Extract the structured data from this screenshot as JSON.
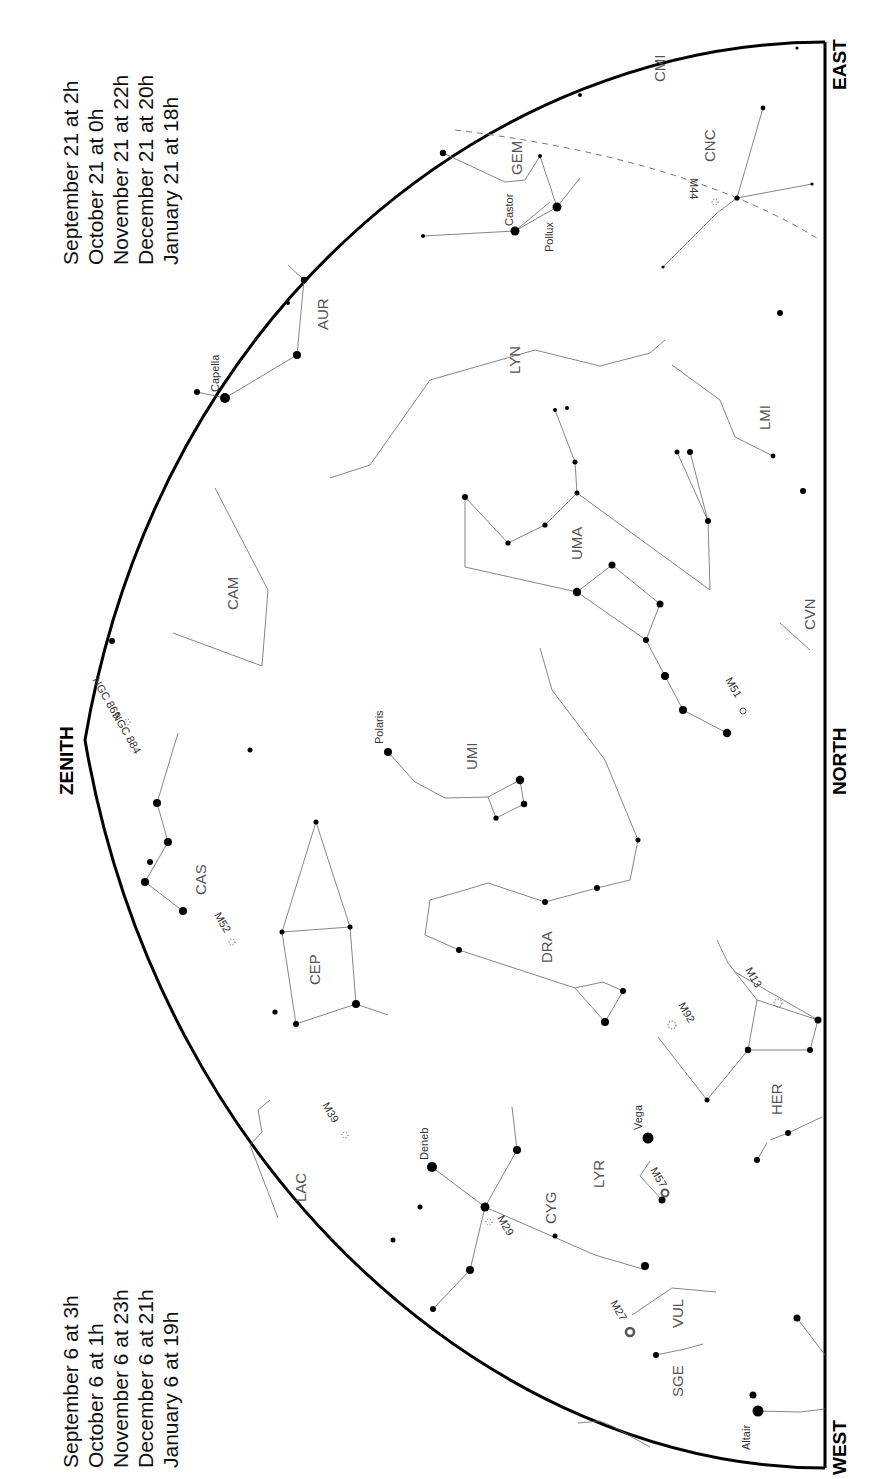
{
  "directions": {
    "east": "EAST",
    "north": "NORTH",
    "west": "WEST",
    "zenith": "ZENITH"
  },
  "dates_top": [
    "September 21 at   2h",
    "October 21 at   0h",
    "November 21 at 22h",
    "December 21 at 20h",
    "January 21 at 18h"
  ],
  "dates_bottom": [
    "September 6 at   3h",
    "October 6 at   1h",
    "November 6 at 23h",
    "December 6 at 21h",
    "January 6 at 19h"
  ],
  "constellations": [
    "CMI",
    "CNC",
    "GEM",
    "AUR",
    "LYN",
    "LMI",
    "CAM",
    "UMA",
    "CVN",
    "CAS",
    "UMI",
    "DRA",
    "CEP",
    "LAC",
    "HER",
    "LYR",
    "CYG",
    "VUL",
    "SGE"
  ],
  "stars": [
    "Castor",
    "Pollux",
    "Capella",
    "Polaris",
    "Deneb",
    "Vega",
    "Altair"
  ],
  "objects": [
    "M44",
    "NGC 884",
    "NGC 869",
    "M52",
    "M51",
    "M92",
    "M13",
    "M57",
    "M39",
    "M29",
    "M27"
  ]
}
